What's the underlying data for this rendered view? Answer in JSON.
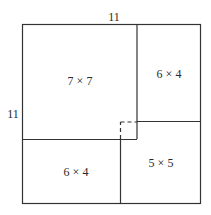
{
  "diagram": {
    "outer_square": {
      "side_top_label": "11",
      "side_left_label": "11"
    },
    "pieces": [
      {
        "id": "big",
        "label": "7 × 7"
      },
      {
        "id": "top-right",
        "label": "6 × 4"
      },
      {
        "id": "bottom-left",
        "label": "6 × 4"
      },
      {
        "id": "bottom-right",
        "label": "5 × 5"
      }
    ],
    "colors": {
      "line": "#333333",
      "background": "#ffffff"
    }
  }
}
